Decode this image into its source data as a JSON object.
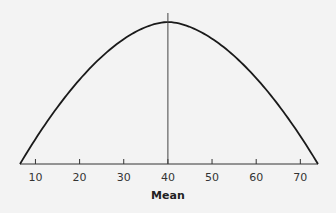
{
  "chart_data": {
    "type": "line",
    "title": "",
    "xlabel": "Mean",
    "ylabel": "",
    "xlim": [
      6.5,
      74
    ],
    "ylim": [
      0,
      1
    ],
    "xticks": [
      10,
      20,
      30,
      40,
      50,
      60,
      70
    ],
    "xtick_labels": [
      "10",
      "20",
      "30",
      "40",
      "50",
      "60",
      "70"
    ],
    "grid": false,
    "series": [
      {
        "name": "distribution-curve",
        "description": "symmetric bell-shaped curve centered on the mean",
        "center": 40,
        "x": [
          6.5,
          10,
          15,
          20,
          25,
          30,
          35,
          40,
          45,
          50,
          55,
          60,
          65,
          70,
          74
        ],
        "y": [
          0.0,
          0.11,
          0.29,
          0.48,
          0.66,
          0.81,
          0.93,
          1.0,
          0.93,
          0.81,
          0.66,
          0.48,
          0.29,
          0.11,
          0.0
        ]
      }
    ],
    "annotations": [
      {
        "type": "vertical-line",
        "x": 40,
        "label": "mean"
      }
    ],
    "colors": {
      "curve": "#1a1a1a",
      "axis": "#333333",
      "background": "#f3f3f3"
    }
  }
}
